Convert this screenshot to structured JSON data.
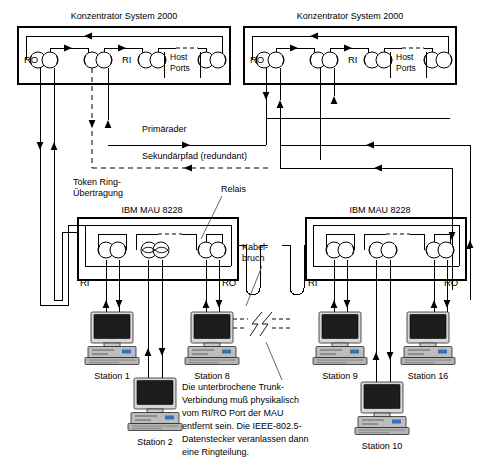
{
  "diagram": {
    "concentrators": [
      {
        "name": "Konzentrator System 2000",
        "ports": {
          "ro": "RO",
          "ri": "RI",
          "host": "Host",
          "ports": "Ports"
        }
      },
      {
        "name": "Konzentrator System 2000",
        "ports": {
          "ro": "RO",
          "ri": "RI",
          "host": "Host",
          "ports": "Ports"
        }
      }
    ],
    "maus": [
      {
        "name": "IBM MAU 8228",
        "ri": "RI",
        "ro": "RO"
      },
      {
        "name": "IBM MAU 8228",
        "ri": "RI",
        "ro": "RO"
      }
    ],
    "path_labels": {
      "primary": "Primärader",
      "secondary": "Sekundärpfad (redundant)"
    },
    "annotations": {
      "transmission_line1": "Token Ring-",
      "transmission_line2": "Übertragung",
      "relay": "Relais",
      "cable_break_line1": "Kabel-",
      "cable_break_line2": "bruch"
    },
    "note": {
      "lines": [
        "Die unterbrochene Trunk-",
        "Verbindung muß physikalisch",
        "vom RI/RO Port der MAU",
        "entfernt sein. Die IEEE-802.5-",
        "Datenstecker veranlassen dann",
        "eine Ringteilung."
      ]
    },
    "stations": [
      {
        "label": "Station 1"
      },
      {
        "label": "Station 2"
      },
      {
        "label": "Station 8"
      },
      {
        "label": "Station 9"
      },
      {
        "label": "Station 10"
      },
      {
        "label": "Station 16"
      }
    ],
    "colors": {
      "line": "#000000",
      "background": "#ffffff",
      "pc_screen": "#1c1c1c",
      "pc_case": "#c9c9c9"
    }
  }
}
